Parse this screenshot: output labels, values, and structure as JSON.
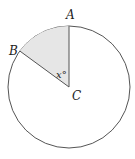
{
  "diagram": {
    "type": "circle-sector",
    "labels": {
      "point_a": "A",
      "point_b": "B",
      "center_c": "C",
      "angle": "x°"
    },
    "colors": {
      "stroke": "#555555",
      "sector_fill": "#e6e6e6",
      "radius_stroke": "#777777"
    }
  }
}
